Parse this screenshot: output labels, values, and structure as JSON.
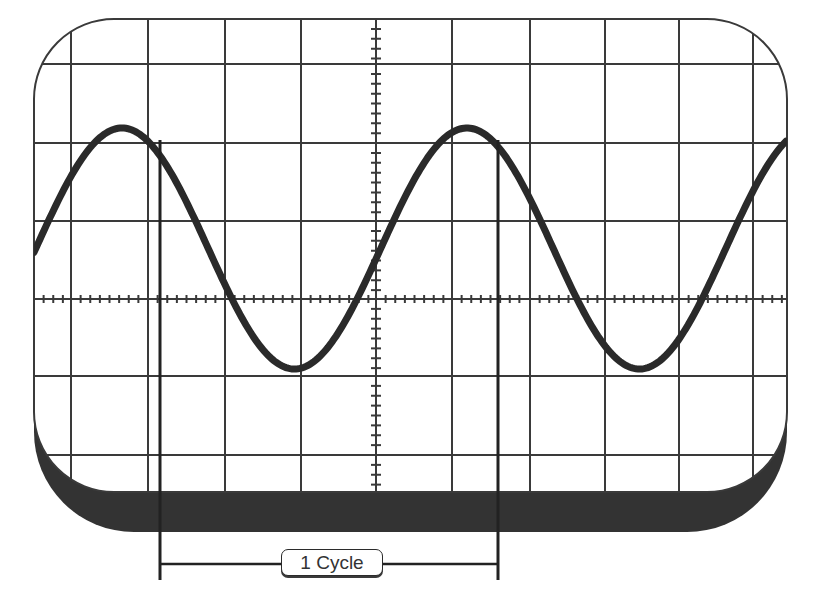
{
  "diagram": {
    "label": "1 Cycle",
    "colors": {
      "background": "#ffffff",
      "grid": "#3a3a3a",
      "wave": "#2a2a2a",
      "bezel_shadow": "#333333",
      "marker": "#222222"
    },
    "screen": {
      "left": 34,
      "top": 19,
      "right": 787,
      "bottom": 492,
      "corner_radius": 80,
      "shadow_bottom": 532
    },
    "grid": {
      "vertical_lines": [
        71,
        148,
        225,
        301,
        376,
        452,
        530,
        605,
        679,
        753
      ],
      "horizontal_lines": [
        64,
        143,
        221,
        299,
        376,
        455
      ],
      "center_x": 376,
      "center_y": 299,
      "minor_divisions": 8
    },
    "wave": {
      "type": "sine",
      "peak_x": 122,
      "period_px": 345,
      "center_y": 248.5,
      "amplitude_px": 120.5,
      "stroke_width": 7
    },
    "markers": {
      "left_x": 160,
      "right_x": 498,
      "top_y": 140,
      "bottom_y": 580,
      "bracket_y": 564
    }
  },
  "chart_data": {
    "type": "line",
    "title": "1 Cycle",
    "xlabel": "",
    "ylabel": "",
    "series": [
      {
        "name": "sine wave",
        "description": "Two full cycles of a sine wave on a 10x6 division oscilloscope graticule; one cycle spans ~4.5 horizontal divisions, peak-to-peak ~3 vertical divisions"
      }
    ],
    "annotations": [
      "1 Cycle (bracket between two successive peaks)"
    ],
    "grid": true
  }
}
